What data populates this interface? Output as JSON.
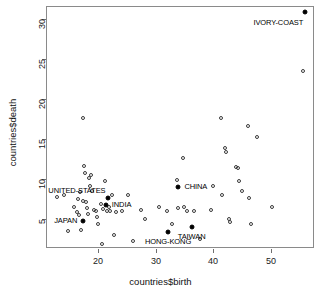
{
  "chart_data": {
    "type": "scatter",
    "title": "",
    "xlabel": "countries$birth",
    "ylabel": "countries$death",
    "xlim": [
      11.0,
      57.5
    ],
    "ylim": [
      3.4,
      33.6
    ],
    "xticks": [
      20,
      30,
      40,
      50
    ],
    "yticks": [
      5,
      10,
      15,
      20,
      25,
      30
    ],
    "grid": false,
    "legend": "none",
    "series": [
      {
        "name": "unlabelled-countries",
        "marker": "open-circle",
        "points": [
          {
            "x": 12.7,
            "y": 9.9
          },
          {
            "x": 14.0,
            "y": 10.2
          },
          {
            "x": 14.6,
            "y": 5.7
          },
          {
            "x": 15.6,
            "y": 8.6
          },
          {
            "x": 16.2,
            "y": 8.0
          },
          {
            "x": 16.4,
            "y": 9.6
          },
          {
            "x": 16.6,
            "y": 7.7
          },
          {
            "x": 16.8,
            "y": 10.5
          },
          {
            "x": 16.9,
            "y": 5.8
          },
          {
            "x": 17.2,
            "y": 9.4
          },
          {
            "x": 17.3,
            "y": 19.8
          },
          {
            "x": 17.5,
            "y": 13.8
          },
          {
            "x": 17.6,
            "y": 12.9
          },
          {
            "x": 17.8,
            "y": 9.3
          },
          {
            "x": 17.9,
            "y": 8.5
          },
          {
            "x": 18.1,
            "y": 7.8
          },
          {
            "x": 18.3,
            "y": 12.3
          },
          {
            "x": 18.4,
            "y": 11.2
          },
          {
            "x": 18.6,
            "y": 12.6
          },
          {
            "x": 18.8,
            "y": 10.6
          },
          {
            "x": 19.2,
            "y": 8.3
          },
          {
            "x": 19.5,
            "y": 8.1
          },
          {
            "x": 19.6,
            "y": 7.4
          },
          {
            "x": 19.9,
            "y": 6.5
          },
          {
            "x": 20.3,
            "y": 9.0
          },
          {
            "x": 20.6,
            "y": 4.0
          },
          {
            "x": 20.8,
            "y": 8.4
          },
          {
            "x": 21.0,
            "y": 11.9
          },
          {
            "x": 21.4,
            "y": 8.2
          },
          {
            "x": 21.8,
            "y": 8.6
          },
          {
            "x": 22.0,
            "y": 8.2
          },
          {
            "x": 22.3,
            "y": 10.2
          },
          {
            "x": 22.6,
            "y": 5.2
          },
          {
            "x": 23.0,
            "y": 8.0
          },
          {
            "x": 24.0,
            "y": 8.2
          },
          {
            "x": 25.0,
            "y": 10.2
          },
          {
            "x": 26.0,
            "y": 4.4
          },
          {
            "x": 27.3,
            "y": 8.3
          },
          {
            "x": 28.0,
            "y": 7.2
          },
          {
            "x": 30.5,
            "y": 8.6
          },
          {
            "x": 31.8,
            "y": 8.2
          },
          {
            "x": 32.7,
            "y": 6.5
          },
          {
            "x": 33.6,
            "y": 12.0
          },
          {
            "x": 33.8,
            "y": 8.5
          },
          {
            "x": 34.6,
            "y": 14.7
          },
          {
            "x": 34.8,
            "y": 8.7
          },
          {
            "x": 35.3,
            "y": 8.2
          },
          {
            "x": 36.5,
            "y": 8.2
          },
          {
            "x": 37.6,
            "y": 4.6
          },
          {
            "x": 39.5,
            "y": 8.3
          },
          {
            "x": 39.8,
            "y": 11.3
          },
          {
            "x": 41.2,
            "y": 19.8
          },
          {
            "x": 41.4,
            "y": 10.2
          },
          {
            "x": 41.9,
            "y": 16.0
          },
          {
            "x": 42.0,
            "y": 15.5
          },
          {
            "x": 42.6,
            "y": 7.1
          },
          {
            "x": 42.7,
            "y": 6.8
          },
          {
            "x": 43.8,
            "y": 13.6
          },
          {
            "x": 44.1,
            "y": 13.5
          },
          {
            "x": 44.3,
            "y": 11.9
          },
          {
            "x": 44.8,
            "y": 10.6
          },
          {
            "x": 45.8,
            "y": 18.8
          },
          {
            "x": 46.1,
            "y": 9.8
          },
          {
            "x": 46.4,
            "y": 6.5
          },
          {
            "x": 47.5,
            "y": 17.4
          },
          {
            "x": 50.0,
            "y": 8.6
          },
          {
            "x": 55.5,
            "y": 25.6
          }
        ]
      },
      {
        "name": "highlighted-countries",
        "marker": "filled-circle",
        "points": [
          {
            "label": "JAPAN",
            "x": 17.3,
            "y": 6.9,
            "label_pos": "left"
          },
          {
            "label": "UNITED-STATES",
            "x": 21.5,
            "y": 9.8,
            "label_pos": "above-left"
          },
          {
            "label": "INDIA",
            "x": 21.2,
            "y": 8.9,
            "label_pos": "right"
          },
          {
            "label": "CHINA",
            "x": 33.8,
            "y": 11.1,
            "label_pos": "right"
          },
          {
            "label": "HONG-KONG",
            "x": 32.0,
            "y": 5.5,
            "label_pos": "below"
          },
          {
            "label": "TAIWAN",
            "x": 36.1,
            "y": 6.1,
            "label_pos": "below"
          },
          {
            "label": "IVORY-COAST",
            "x": 55.8,
            "y": 33.0,
            "label_pos": "below-left"
          }
        ]
      }
    ]
  }
}
